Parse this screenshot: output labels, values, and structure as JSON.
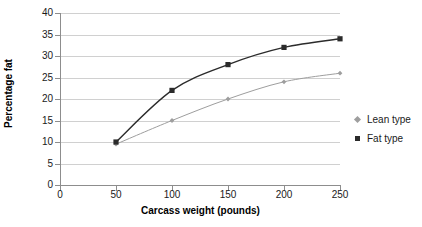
{
  "chart_data": {
    "type": "line",
    "title": "",
    "xlabel": "Carcass weight (pounds)",
    "ylabel": "Percentage fat",
    "x": [
      50,
      100,
      150,
      200,
      250
    ],
    "xlim": [
      0,
      250
    ],
    "ylim": [
      0,
      40
    ],
    "xticks": [
      0,
      50,
      100,
      150,
      200,
      250
    ],
    "yticks": [
      0,
      5,
      10,
      15,
      20,
      25,
      30,
      35,
      40
    ],
    "grid": "horizontal",
    "legend_position": "right",
    "series": [
      {
        "name": "Lean type",
        "marker": "diamond",
        "color": "#9e9e9e",
        "values": [
          9.5,
          15,
          20,
          24,
          26
        ]
      },
      {
        "name": "Fat type",
        "marker": "square",
        "color": "#2b2b2b",
        "values": [
          10,
          22,
          28,
          32,
          34
        ]
      }
    ]
  },
  "axes": {
    "x_tick_labels": [
      "0",
      "50",
      "100",
      "150",
      "200",
      "250"
    ],
    "y_tick_labels": [
      "0",
      "5",
      "10",
      "15",
      "20",
      "25",
      "30",
      "35",
      "40"
    ]
  },
  "legend": {
    "items": [
      {
        "label": "Lean type",
        "marker_name": "diamond-marker-icon"
      },
      {
        "label": "Fat type",
        "marker_name": "square-marker-icon"
      }
    ]
  }
}
